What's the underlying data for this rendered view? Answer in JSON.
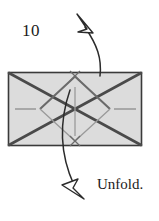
{
  "figure": {
    "step_number": "10",
    "caption": "Unfold.",
    "paper": {
      "shape": "rectangle",
      "fill_color": "#dcdcdc",
      "stroke_color": "#3a3a3a",
      "x": 8,
      "y": 72,
      "width": 134,
      "height": 74
    },
    "creases": [
      {
        "name": "diagonal-top-left-to-bottom-right",
        "type": "mountain-thick",
        "color": "#4a4a4a",
        "x1": 8,
        "y1": 72,
        "x2": 142,
        "y2": 146
      },
      {
        "name": "diagonal-bottom-left-to-top-right",
        "type": "mountain-thick",
        "color": "#4a4a4a",
        "x1": 8,
        "y1": 146,
        "x2": 142,
        "y2": 72
      },
      {
        "name": "diamond-upper-left-edge",
        "type": "valley-thin",
        "color": "#6b6b6b",
        "x1": 40,
        "y1": 109,
        "x2": 75,
        "y2": 76
      },
      {
        "name": "diamond-upper-right-edge",
        "type": "valley-thin",
        "color": "#6b6b6b",
        "x1": 75,
        "y1": 76,
        "x2": 110,
        "y2": 109
      },
      {
        "name": "diamond-lower-left-edge",
        "type": "valley-thin",
        "color": "#8c8c8c",
        "x1": 40,
        "y1": 109,
        "x2": 75,
        "y2": 141
      },
      {
        "name": "diamond-lower-right-edge",
        "type": "valley-thin",
        "color": "#8c8c8c",
        "x1": 75,
        "y1": 141,
        "x2": 110,
        "y2": 109
      },
      {
        "name": "center-vertical-crease",
        "type": "thin",
        "color": "#8c8c8c",
        "x1": 75,
        "y1": 87,
        "x2": 75,
        "y2": 136
      },
      {
        "name": "left-edge-tick",
        "type": "reference-mark",
        "color": "#8c8c8c",
        "x1": 14,
        "y1": 109,
        "x2": 36,
        "y2": 109
      },
      {
        "name": "right-edge-tick",
        "type": "reference-mark",
        "color": "#8c8c8c",
        "x1": 114,
        "y1": 109,
        "x2": 136,
        "y2": 109
      }
    ],
    "x_marks": [
      {
        "name": "x-mark-top-apex",
        "cx": 75,
        "cy": 76,
        "size": 6,
        "color": "#6b6b6b"
      },
      {
        "name": "x-mark-bottom-apex",
        "cx": 75,
        "cy": 141,
        "size": 6,
        "color": "#6b6b6b"
      }
    ],
    "arrows": [
      {
        "name": "unfold-arrow-up",
        "direction": "up-left",
        "color": "#2b2b2b",
        "path": "M 100 75 C 101 58, 96 44, 84 26",
        "head": "82,16 94,32 79,31"
      },
      {
        "name": "unfold-arrow-down",
        "direction": "down-left",
        "color": "#2b2b2b",
        "path": "M 70 90 C 62 116, 58 146, 76 186",
        "head": "82,198 64,188 79,180"
      }
    ]
  }
}
